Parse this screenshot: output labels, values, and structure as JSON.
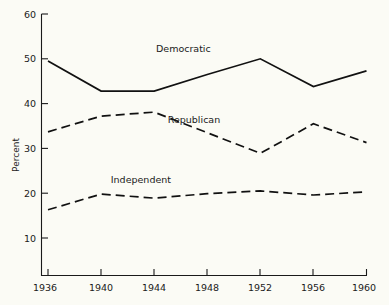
{
  "chart_data": {
    "type": "line",
    "title": "",
    "xlabel": "",
    "ylabel": "Percent",
    "x": [
      1936,
      1940,
      1944,
      1948,
      1952,
      1956,
      1960
    ],
    "xticklabels": [
      "1936",
      "1940",
      "1944",
      "1948",
      "1952",
      "1956",
      "1960"
    ],
    "xlim": [
      1936,
      1960
    ],
    "ylim": [
      0,
      60
    ],
    "yticks": [
      10,
      20,
      30,
      40,
      50,
      60
    ],
    "yticklabels": [
      "10",
      "20",
      "30",
      "40",
      "50",
      "60"
    ],
    "grid": false,
    "legend_position": "inline-annotations",
    "series": [
      {
        "name": "Democratic",
        "style": "solid",
        "color": "#111111",
        "values": [
          49.5,
          42.8,
          42.8,
          46.5,
          50.0,
          43.8,
          47.3
        ]
      },
      {
        "name": "Republican",
        "style": "dashed",
        "color": "#111111",
        "values": [
          33.7,
          37.2,
          38.1,
          33.5,
          28.9,
          35.5,
          31.3
        ]
      },
      {
        "name": "Independent",
        "style": "dashed",
        "color": "#111111",
        "values": [
          16.3,
          19.8,
          18.9,
          19.9,
          20.5,
          19.6,
          20.3
        ]
      }
    ],
    "annotations": [
      {
        "text": "Democratic",
        "x": 1946.2,
        "y": 51.5
      },
      {
        "text": "Republican",
        "x": 1947.0,
        "y": 35.7
      },
      {
        "text": "Independent",
        "x": 1943.0,
        "y": 22.3
      }
    ]
  },
  "axes": {
    "y_axis_title": "Percent",
    "y_tick_labels": [
      "60",
      "50",
      "40",
      "30",
      "20",
      "10"
    ],
    "x_tick_labels": [
      "1936",
      "1940",
      "1944",
      "1948",
      "1952",
      "1956",
      "1960"
    ]
  },
  "series_labels": {
    "democratic": "Democratic",
    "republican": "Republican",
    "independent": "Independent"
  },
  "colors": {
    "ink": "#111111",
    "background": "#fbfbf5"
  }
}
